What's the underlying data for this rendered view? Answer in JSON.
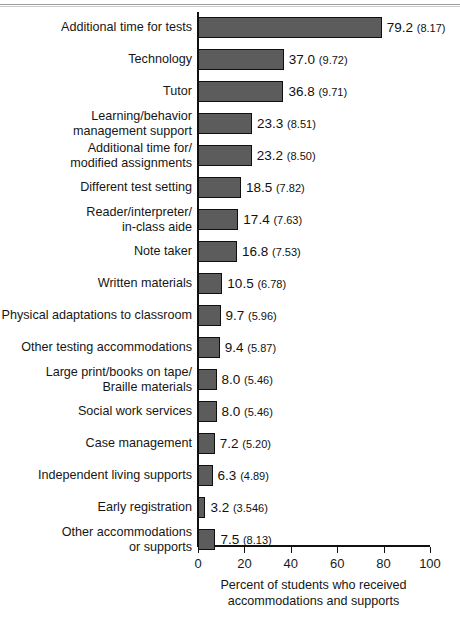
{
  "figure": {
    "background_color": "#ffffff",
    "bar_fill_color": "#5c5c5c",
    "bar_edge_color": "#0f0f0f",
    "axis_color": "#111111"
  },
  "chart_data": {
    "type": "bar",
    "orientation": "horizontal",
    "title": "",
    "subtitle": "",
    "xlabel": "Percent of students who received\naccommodations and supports",
    "ylabel": "",
    "xlim": [
      0,
      100
    ],
    "xticks": [
      "0",
      "20",
      "40",
      "60",
      "80",
      "100"
    ],
    "xtick_values": [
      0,
      20,
      40,
      60,
      80,
      100
    ],
    "grid": false,
    "legend": null,
    "categories": [
      "Additional time for tests",
      "Technology",
      "Tutor",
      "Learning/behavior\nmanagement support",
      "Additional time for/\nmodified assignments",
      "Different test setting",
      "Reader/interpreter/\nin-class aide",
      "Note taker",
      "Written materials",
      "Physical adaptations to classroom",
      "Other testing accommodations",
      "Large print/books on tape/\nBraille materials",
      "Social work services",
      "Case management",
      "Independent living supports",
      "Early registration",
      "Other accommodations\nor supports"
    ],
    "values": [
      79.2,
      37.0,
      36.8,
      23.3,
      23.2,
      18.5,
      17.4,
      16.8,
      10.5,
      9.7,
      9.4,
      8.0,
      8.0,
      7.2,
      6.3,
      3.2,
      7.5
    ],
    "errors": [
      8.17,
      9.72,
      9.71,
      8.51,
      8.5,
      7.82,
      7.63,
      7.53,
      6.78,
      5.96,
      5.87,
      5.46,
      5.46,
      5.2,
      4.89,
      3.546,
      8.13
    ],
    "data_labels": [
      "79.2",
      "37.0",
      "36.8",
      "23.3",
      "23.2",
      "18.5",
      "17.4",
      "16.8",
      "10.5",
      "9.7",
      "9.4",
      "8.0",
      "8.0",
      "7.2",
      "6.3",
      "3.2",
      "7.5"
    ],
    "error_labels": [
      "(8.17)",
      "(9.72)",
      "(9.71)",
      "(8.51)",
      "(8.50)",
      "(7.82)",
      "(7.63)",
      "(7.53)",
      "(6.78)",
      "(5.96)",
      "(5.87)",
      "(5.46)",
      "(5.46)",
      "(5.20)",
      "(4.89)",
      "(3.546)",
      "(8.13)"
    ]
  }
}
